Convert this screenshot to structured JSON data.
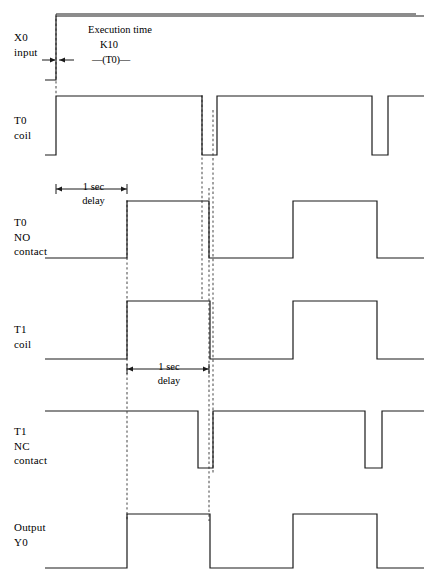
{
  "diagram": {
    "colors": {
      "signal": "#1a1a1a",
      "dashed": "#555555",
      "background": "#ffffff"
    },
    "rows": [
      {
        "id": "x0-input",
        "label_lines": [
          "X0",
          "input"
        ],
        "label_x": 14,
        "label_y": 30
      },
      {
        "id": "t0-coil",
        "label_lines": [
          "T0",
          "coil"
        ],
        "label_x": 14,
        "label_y": 113
      },
      {
        "id": "t0-no",
        "label_lines": [
          "T0",
          "NO",
          "contact"
        ],
        "label_x": 14,
        "label_y": 215
      },
      {
        "id": "t1-coil",
        "label_lines": [
          "T1",
          "coil"
        ],
        "label_x": 14,
        "label_y": 322
      },
      {
        "id": "t1-nc",
        "label_lines": [
          "T1",
          "NC",
          "contact"
        ],
        "label_x": 14,
        "label_y": 424
      },
      {
        "id": "output-y0",
        "label_lines": [
          "Output",
          "Y0"
        ],
        "label_x": 14,
        "label_y": 520
      }
    ],
    "annotations": {
      "execution_time": {
        "line1": "Execution time",
        "line2": "K10",
        "line3_prefix": "—(",
        "line3_name": "T0",
        "line3_suffix": ")—",
        "x": 88,
        "y": 22
      },
      "delay1": {
        "line1": "1 sec",
        "line2": "delay",
        "x": 58,
        "y": 180,
        "span_from": 56,
        "span_to": 127,
        "arrow_y": 189
      },
      "delay2": {
        "line1": "1 sec",
        "line2": "delay",
        "x": 128,
        "y": 360,
        "span_from": 127,
        "span_to": 209,
        "arrow_y": 369
      }
    }
  },
  "chart_data": {
    "type": "line",
    "xlabel": "",
    "ylabel": "",
    "xlim": [
      45,
      424
    ],
    "grid": false,
    "legend": "none",
    "note": "Digital waveform timing chart. Each series is a logic signal sampled as (x_pixel, level) transition points; level 1 = high, 0 = low.",
    "markers": {
      "dashed_verticals": [
        {
          "x": 56,
          "y1": 14,
          "y2": 95
        },
        {
          "x": 127,
          "y1": 200,
          "y2": 521
        },
        {
          "x": 202,
          "y1": 95,
          "y2": 300
        },
        {
          "x": 209,
          "y1": 188,
          "y2": 521
        },
        {
          "x": 213,
          "y1": 110,
          "y2": 473
        }
      ],
      "top_border": {
        "x1": 56,
        "x2": 416,
        "y": 14
      }
    },
    "series": [
      {
        "name": "X0 input",
        "row": "x0-input",
        "baseline_y": 80,
        "high_y": 16,
        "transitions": [
          [
            45,
            0
          ],
          [
            56,
            1
          ],
          [
            424,
            1
          ]
        ]
      },
      {
        "name": "T0 coil",
        "row": "t0-coil",
        "baseline_y": 155,
        "high_y": 96,
        "transitions": [
          [
            45,
            0
          ],
          [
            56,
            1
          ],
          [
            202,
            0
          ],
          [
            217,
            1
          ],
          [
            372,
            0
          ],
          [
            388,
            1
          ],
          [
            424,
            1
          ]
        ]
      },
      {
        "name": "T0 NO contact",
        "row": "t0-no",
        "baseline_y": 258,
        "high_y": 201,
        "transitions": [
          [
            45,
            0
          ],
          [
            127,
            1
          ],
          [
            209,
            0
          ],
          [
            293,
            1
          ],
          [
            377,
            0
          ],
          [
            424,
            0
          ]
        ]
      },
      {
        "name": "T1 coil",
        "row": "t1-coil",
        "baseline_y": 359,
        "high_y": 301,
        "transitions": [
          [
            45,
            0
          ],
          [
            127,
            1
          ],
          [
            210,
            0
          ],
          [
            293,
            1
          ],
          [
            377,
            0
          ],
          [
            424,
            0
          ]
        ]
      },
      {
        "name": "T1 NC contact",
        "row": "t1-nc",
        "baseline_y": 468,
        "high_y": 411,
        "transitions": [
          [
            45,
            1
          ],
          [
            198,
            0
          ],
          [
            213,
            1
          ],
          [
            365,
            0
          ],
          [
            382,
            1
          ],
          [
            424,
            1
          ]
        ]
      },
      {
        "name": "Output Y0",
        "row": "output-y0",
        "baseline_y": 568,
        "high_y": 514,
        "transitions": [
          [
            45,
            0
          ],
          [
            127,
            1
          ],
          [
            210,
            0
          ],
          [
            293,
            1
          ],
          [
            377,
            0
          ],
          [
            424,
            0
          ]
        ]
      }
    ]
  }
}
